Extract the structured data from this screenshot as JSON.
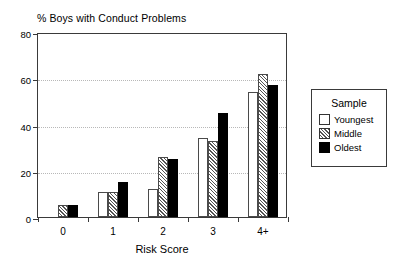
{
  "chart_data": {
    "type": "bar",
    "title": "% Boys with Conduct Problems",
    "xlabel": "Risk Score",
    "ylabel": "",
    "categories": [
      "0",
      "1",
      "2",
      "3",
      "4+"
    ],
    "ylim": [
      0,
      80
    ],
    "yticks": [
      0,
      20,
      40,
      60,
      80
    ],
    "ytick_labels": [
      "0",
      "20",
      "40",
      "60",
      "80"
    ],
    "grid": true,
    "grid_axis": "y",
    "legend_position": "right-outside",
    "legend_title": "Sample",
    "series": [
      {
        "name": "Youngest",
        "fill": "open",
        "values": [
          0,
          11,
          12,
          34,
          54
        ]
      },
      {
        "name": "Middle",
        "fill": "hatch",
        "values": [
          5,
          11,
          26,
          33,
          62
        ]
      },
      {
        "name": "Oldest",
        "fill": "solid",
        "values": [
          5,
          15,
          25,
          45,
          57
        ]
      }
    ],
    "colors": {
      "axis": "#3a3a3a",
      "grid": "#b8b8b8",
      "bar_edge": "#4a4a4a",
      "solid_fill": "#000000",
      "background": "#ffffff"
    }
  }
}
